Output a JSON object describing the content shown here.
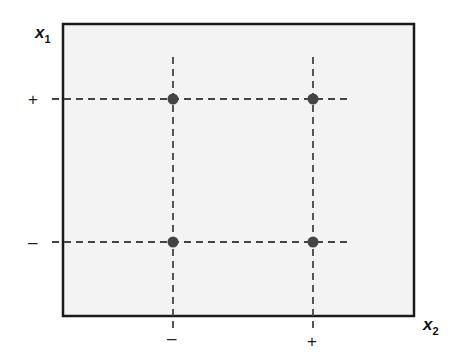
{
  "diagram": {
    "frame": {
      "fill": "#f3f3f3",
      "stroke": "#1a1a1a"
    },
    "point_color": "#444444",
    "line_color": "#444444",
    "y_axis": {
      "label": "x",
      "subscript": "1",
      "ticks": [
        {
          "label": "+",
          "level": "high"
        },
        {
          "label": "–",
          "level": "low"
        }
      ]
    },
    "x_axis": {
      "label": "x",
      "subscript": "2",
      "ticks": [
        {
          "label": "–",
          "level": "low"
        },
        {
          "label": "+",
          "level": "high"
        }
      ]
    },
    "points": [
      {
        "x2": "–",
        "x1": "+"
      },
      {
        "x2": "+",
        "x1": "+"
      },
      {
        "x2": "–",
        "x1": "–"
      },
      {
        "x2": "+",
        "x1": "–"
      }
    ]
  }
}
